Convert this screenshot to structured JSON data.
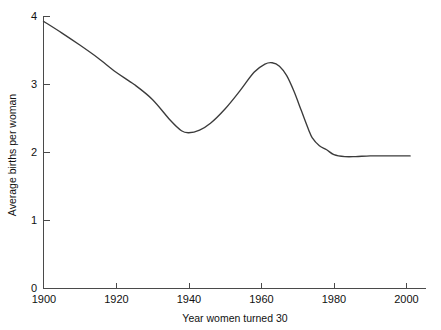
{
  "chart_data": {
    "type": "line",
    "title": "",
    "xlabel": "Year women turned 30",
    "ylabel": "Average births per woman",
    "xlim": [
      1900,
      2005
    ],
    "ylim": [
      0,
      4
    ],
    "grid": false,
    "legend": "none",
    "xticks": [
      1900,
      1920,
      1940,
      1960,
      1980,
      2000
    ],
    "xtick_labels": [
      "1900",
      "1920",
      "1940",
      "1960",
      "1980",
      "2000"
    ],
    "yticks": [
      0,
      1,
      2,
      3,
      4
    ],
    "ytick_labels": [
      "0",
      "1",
      "2",
      "3",
      "4"
    ],
    "series": [
      {
        "name": "Average births per woman",
        "color": "#3b3b3b",
        "x": [
          1900,
          1905,
          1910,
          1915,
          1920,
          1925,
          1930,
          1935,
          1938,
          1940,
          1943,
          1946,
          1950,
          1954,
          1958,
          1961,
          1963,
          1965,
          1967,
          1969,
          1971,
          1973,
          1974,
          1976,
          1978,
          1980,
          1983,
          1986,
          1990,
          1995,
          2000,
          2001
        ],
        "y": [
          3.93,
          3.76,
          3.58,
          3.39,
          3.18,
          3.0,
          2.78,
          2.47,
          2.32,
          2.29,
          2.33,
          2.43,
          2.64,
          2.9,
          3.18,
          3.3,
          3.32,
          3.27,
          3.13,
          2.9,
          2.62,
          2.34,
          2.22,
          2.1,
          2.04,
          1.97,
          1.94,
          1.94,
          1.95,
          1.95,
          1.95,
          1.95
        ]
      }
    ],
    "annotations": []
  },
  "axes": {
    "x_axis_label": "Year women turned 30",
    "y_axis_label": "Average births per woman"
  }
}
